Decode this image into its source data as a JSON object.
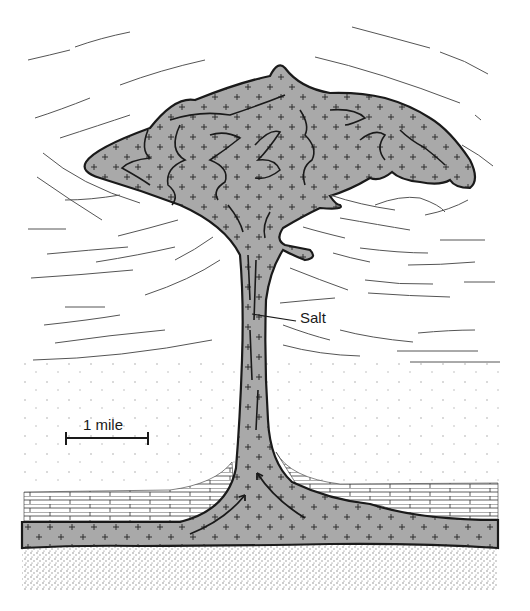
{
  "figure": {
    "labels": {
      "salt": "Salt",
      "scale": "1 mile"
    },
    "colors": {
      "salt_fill": "#a9a9a9",
      "outline": "#1a1a1a",
      "strata_lines": "#555555",
      "background": "#ffffff",
      "basement_dots": "#777777"
    },
    "layers": [
      {
        "name": "upturned-sediment-lines",
        "pattern": "curved dashes"
      },
      {
        "name": "sandstone",
        "pattern": "sparse dots"
      },
      {
        "name": "limestone",
        "pattern": "brick"
      },
      {
        "name": "salt-source-layer",
        "pattern": "gray with crosses"
      },
      {
        "name": "basement",
        "pattern": "dense stipple"
      }
    ]
  }
}
